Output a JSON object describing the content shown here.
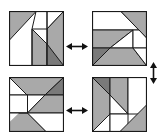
{
  "figure": {
    "colors": {
      "light_gray": "#a9a9a9",
      "dark_gray": "#7a7a7a",
      "white": "#ffffff",
      "stroke": "#1a1a1a"
    },
    "panels": [
      {
        "id": "top-left",
        "position": "top-left"
      },
      {
        "id": "top-right",
        "position": "top-right"
      },
      {
        "id": "bottom-left",
        "position": "bottom-left"
      },
      {
        "id": "bottom-right",
        "position": "bottom-right"
      }
    ],
    "arrows": [
      {
        "from": "top-left",
        "to": "top-right",
        "direction": "horizontal",
        "glyph": "double-headed"
      },
      {
        "from": "top-right",
        "to": "bottom-right",
        "direction": "vertical",
        "glyph": "double-headed"
      },
      {
        "from": "bottom-left",
        "to": "bottom-right",
        "direction": "horizontal",
        "glyph": "double-headed"
      }
    ]
  }
}
